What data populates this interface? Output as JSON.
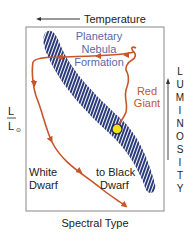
{
  "diagram": {
    "title_axis_top": "Temperature",
    "axis_bottom": "Spectral Type",
    "axis_left_numerator": "L",
    "axis_left_denominator": "L",
    "axis_left_sub": "⊙",
    "axis_right_letters": [
      "L",
      "U",
      "M",
      "I",
      "N",
      "O",
      "S",
      "I",
      "T",
      "Y"
    ],
    "labels": {
      "planetary_line1": "Planetary",
      "planetary_line2": "Nebula",
      "planetary_line3": "Formation",
      "red_giant_line1": "Red",
      "red_giant_line2": "Giant",
      "white_dwarf_line1": "White",
      "white_dwarf_line2": "Dwarf",
      "black_dwarf_line1": "to Black",
      "black_dwarf_line2": "Dwarf"
    },
    "colors": {
      "main_sequence_band": "#2a3a7a",
      "band_stripe": "#ffffff",
      "evolution_track": "#c8552a",
      "sun_marker": "#f2e01c",
      "label_blue": "#5a6aa8",
      "label_orange": "#c8552a",
      "frame": "#888888",
      "text": "#222222"
    }
  }
}
